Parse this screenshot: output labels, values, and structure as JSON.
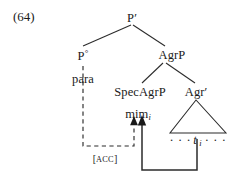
{
  "figure": {
    "example_number": "(64)",
    "type": "syntactic-tree",
    "language_note": ""
  },
  "nodes": {
    "root": {
      "label": "P",
      "prime": "′",
      "full": "P′"
    },
    "head_p": {
      "label": "P",
      "degree": "°",
      "full": "P°"
    },
    "agrp": {
      "label": "AgrP"
    },
    "spec_agrp": {
      "label": "SpecAgrP"
    },
    "agr_bar": {
      "label": "Agr",
      "prime": "′",
      "full": "Agr′"
    },
    "para": {
      "label": "para"
    },
    "mim": {
      "label": "mim",
      "subscript": "i"
    },
    "trace": {
      "pre_dots": "· · ·",
      "label": "t",
      "subscript": "i",
      "post_dots": "· · ·"
    }
  },
  "annotations": {
    "case_feature": {
      "bracket_open": "[",
      "text": "ACC",
      "bracket_close": "]"
    }
  },
  "colors": {
    "ink": "#1a1a1a",
    "line": "#2b2b2b",
    "background": "#ffffff"
  }
}
